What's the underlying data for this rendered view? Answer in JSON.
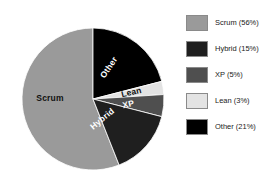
{
  "chart_data": {
    "type": "pie",
    "title": "",
    "categories": [
      "Scrum",
      "Hybrid",
      "XP",
      "Lean",
      "Other"
    ],
    "values": [
      56,
      15,
      5,
      3,
      21
    ],
    "unit": "%",
    "legend_position": "right",
    "grid": false,
    "slice_labels": [
      {
        "name": "Scrum",
        "text": "Scrum"
      },
      {
        "name": "Other",
        "text": "Other"
      },
      {
        "name": "Lean",
        "text": "Lean"
      },
      {
        "name": "XP",
        "text": "XP"
      },
      {
        "name": "Hybrid",
        "text": "Hybrid"
      }
    ],
    "colors": {
      "Scrum": "#9a9a9a",
      "Hybrid": "#1f1f1f",
      "XP": "#4f4f4f",
      "Lean": "#e3e3e3",
      "Other": "#000000"
    }
  },
  "legend": {
    "items": [
      {
        "label": "Scrum (56%)",
        "color": "#9a9a9a"
      },
      {
        "label": "Hybrid (15%)",
        "color": "#1f1f1f"
      },
      {
        "label": "XP (5%)",
        "color": "#4f4f4f"
      },
      {
        "label": "Lean (3%)",
        "color": "#e3e3e3"
      },
      {
        "label": "Other (21%)",
        "color": "#000000"
      }
    ]
  },
  "pie_labels": {
    "scrum": "Scrum",
    "other": "Other",
    "lean": "Lean",
    "xp": "XP",
    "hybrid": "Hybrid"
  }
}
